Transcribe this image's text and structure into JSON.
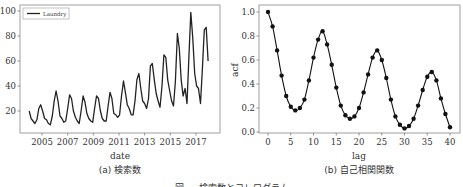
{
  "figure_caption": "図 ... 検索数とコレログラム",
  "chart_data": [
    {
      "type": "line",
      "panel": "a",
      "caption": "(a) 検索数",
      "xlabel": "date",
      "ylabel": "",
      "legend": [
        "Laundry"
      ],
      "legend_position": "upper left",
      "xticks": [
        "2005",
        "2007",
        "2009",
        "2011",
        "2013",
        "2015",
        "2017"
      ],
      "yticks": [
        20,
        40,
        60,
        80,
        100
      ],
      "xlim": [
        2004.0,
        2018.8
      ],
      "ylim": [
        5,
        103
      ],
      "grid": false,
      "series": [
        {
          "name": "Laundry",
          "x": [
            2004.0,
            2004.15,
            2004.3,
            2004.45,
            2004.6,
            2004.75,
            2004.9,
            2005.05,
            2005.2,
            2005.35,
            2005.5,
            2005.65,
            2005.8,
            2005.95,
            2006.1,
            2006.25,
            2006.4,
            2006.55,
            2006.7,
            2006.85,
            2007.0,
            2007.15,
            2007.3,
            2007.45,
            2007.6,
            2007.75,
            2007.9,
            2008.05,
            2008.2,
            2008.35,
            2008.5,
            2008.65,
            2008.8,
            2008.95,
            2009.1,
            2009.25,
            2009.4,
            2009.55,
            2009.7,
            2009.85,
            2010.0,
            2010.15,
            2010.3,
            2010.45,
            2010.6,
            2010.75,
            2010.9,
            2011.05,
            2011.2,
            2011.35,
            2011.5,
            2011.65,
            2011.8,
            2011.95,
            2012.1,
            2012.25,
            2012.4,
            2012.55,
            2012.7,
            2012.85,
            2013.0,
            2013.15,
            2013.3,
            2013.45,
            2013.6,
            2013.75,
            2013.9,
            2014.05,
            2014.2,
            2014.35,
            2014.5,
            2014.65,
            2014.8,
            2014.95,
            2015.1,
            2015.25,
            2015.4,
            2015.55,
            2015.7,
            2015.85,
            2016.0,
            2016.15,
            2016.3,
            2016.45,
            2016.6,
            2016.75,
            2016.9,
            2017.05,
            2017.2,
            2017.35,
            2017.5,
            2017.65,
            2017.8,
            2017.95
          ],
          "values": [
            20,
            14,
            12,
            10,
            13,
            22,
            25,
            20,
            14,
            13,
            10,
            9,
            16,
            28,
            36,
            28,
            16,
            14,
            11,
            12,
            22,
            33,
            30,
            20,
            15,
            12,
            10,
            20,
            32,
            27,
            18,
            14,
            12,
            11,
            22,
            32,
            30,
            20,
            14,
            12,
            12,
            24,
            35,
            30,
            18,
            17,
            15,
            17,
            32,
            44,
            35,
            25,
            22,
            17,
            17,
            28,
            45,
            50,
            38,
            28,
            26,
            22,
            30,
            56,
            58,
            45,
            34,
            28,
            23,
            40,
            65,
            63,
            45,
            36,
            28,
            24,
            44,
            82,
            70,
            45,
            32,
            38,
            26,
            63,
            99,
            78,
            50,
            40,
            38,
            26,
            54,
            85,
            87,
            60,
            50,
            40,
            31,
            55,
            86,
            75,
            52
          ],
          "color": "#222222"
        }
      ]
    },
    {
      "type": "line",
      "panel": "b",
      "caption": "(b) 自己相関関数",
      "xlabel": "lag",
      "ylabel": "acf",
      "xticks": [
        0,
        5,
        10,
        15,
        20,
        25,
        30,
        35,
        40
      ],
      "yticks": [
        "0.0",
        "0.2",
        "0.4",
        "0.6",
        "0.8",
        "1.0"
      ],
      "xlim": [
        -2,
        42
      ],
      "ylim": [
        -0.01,
        1.04
      ],
      "grid": false,
      "markers": true,
      "series": [
        {
          "name": "acf",
          "x": [
            0,
            1,
            2,
            3,
            4,
            5,
            6,
            7,
            8,
            9,
            10,
            11,
            12,
            13,
            14,
            15,
            16,
            17,
            18,
            19,
            20,
            21,
            22,
            23,
            24,
            25,
            26,
            27,
            28,
            29,
            30,
            31,
            32,
            33,
            34,
            35,
            36,
            37,
            38,
            39,
            40
          ],
          "values": [
            1.0,
            0.88,
            0.68,
            0.47,
            0.3,
            0.21,
            0.18,
            0.2,
            0.27,
            0.43,
            0.62,
            0.77,
            0.84,
            0.73,
            0.56,
            0.37,
            0.22,
            0.14,
            0.11,
            0.13,
            0.2,
            0.33,
            0.48,
            0.62,
            0.68,
            0.6,
            0.45,
            0.27,
            0.13,
            0.06,
            0.03,
            0.05,
            0.11,
            0.22,
            0.35,
            0.46,
            0.5,
            0.43,
            0.28,
            0.15,
            0.04
          ],
          "color": "#111111"
        }
      ]
    }
  ]
}
